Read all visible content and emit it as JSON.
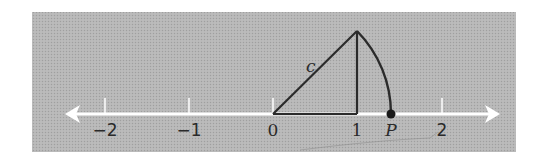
{
  "figure": {
    "background_color": "#b4b4b4",
    "axis_color": "#ffffff",
    "line_color": "#2b2b2b",
    "number_line": {
      "ticks": [
        {
          "value": -2,
          "label": "−2"
        },
        {
          "value": -1,
          "label": "−1"
        },
        {
          "value": 0,
          "label": "0"
        },
        {
          "value": 1,
          "label": "1"
        },
        {
          "value": 2,
          "label": "2"
        }
      ]
    },
    "triangle": {
      "hypotenuse_label": "c",
      "legs": [
        1,
        1
      ]
    },
    "point": {
      "label": "P",
      "value": 1.414
    }
  }
}
